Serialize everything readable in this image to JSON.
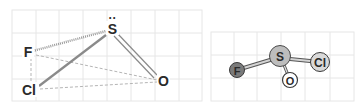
{
  "left_panel": {
    "title": "2D structural formula",
    "atoms": {
      "S": {
        "label": "S",
        "lone_pair": "··"
      },
      "F": {
        "label": "F"
      },
      "Cl": {
        "label": "Cl"
      },
      "O": {
        "label": "O"
      }
    },
    "bonds": [
      {
        "from": "S",
        "to": "F",
        "style": "hashed"
      },
      {
        "from": "S",
        "to": "Cl",
        "style": "solid-thick"
      },
      {
        "from": "S",
        "to": "O",
        "style": "double"
      },
      {
        "from": "F",
        "to": "Cl",
        "style": "dashed"
      },
      {
        "from": "F",
        "to": "O",
        "style": "dashed"
      },
      {
        "from": "Cl",
        "to": "O",
        "style": "dashed"
      }
    ]
  },
  "right_panel": {
    "title": "3D ball-and-stick model",
    "atoms": {
      "S": {
        "label": "S",
        "color": "#bdbdbd"
      },
      "F": {
        "label": "F",
        "color": "#7a7a7a"
      },
      "Cl": {
        "label": "Cl",
        "color": "#d9d9d9"
      },
      "O": {
        "label": "O",
        "color": "#ffffff"
      }
    }
  },
  "colors": {
    "grid": "#e3e3e3",
    "bond": "#8a8a8a",
    "dashed": "#b5b5b5",
    "text": "#2a2a2a"
  }
}
